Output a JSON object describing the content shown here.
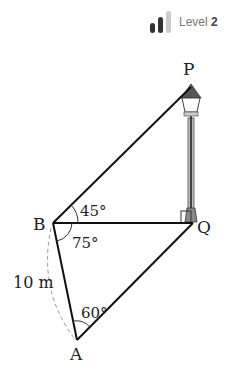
{
  "badge": {
    "label": "Level",
    "level_number": "2",
    "bar_colors": [
      "#333333",
      "#333333",
      "#cccccc"
    ]
  },
  "diagram": {
    "points": {
      "P": {
        "label": "P",
        "x": 191,
        "y": 87
      },
      "Q": {
        "label": "Q",
        "x": 193,
        "y": 223
      },
      "B": {
        "label": "B",
        "x": 53,
        "y": 223
      },
      "A": {
        "label": "A",
        "x": 77,
        "y": 340
      }
    },
    "angles": {
      "PBQ": "45°",
      "QBA": "75°",
      "BAQ": "60°"
    },
    "length_label": "10 m",
    "right_angle_at": "Q",
    "object": "street lamp at PQ"
  }
}
